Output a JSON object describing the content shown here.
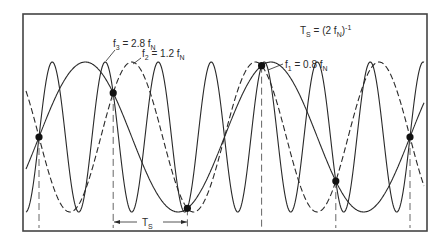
{
  "annotations": {
    "ts_def": {
      "main": "T",
      "sub": "S",
      "rest": " = (2 f",
      "sub2": "N",
      "tail": ")",
      "sup": "-1"
    },
    "f1": {
      "main": "f",
      "sub": "1",
      "rest": " = 0.8 f",
      "sub2": "N"
    },
    "f2": {
      "main": "f",
      "sub": "2",
      "rest": " = 1.2 f",
      "sub2": "N"
    },
    "f3": {
      "main": "f",
      "sub": "3",
      "rest": " = 2.8 f",
      "sub2": "N"
    },
    "ts_span": {
      "main": "T",
      "sub": "S"
    }
  },
  "signals": [
    {
      "name": "f1",
      "ratio_to_fN": 0.8,
      "style": "solid",
      "sign": 1
    },
    {
      "name": "f2",
      "ratio_to_fN": 1.2,
      "style": "dashed",
      "sign": -1
    },
    {
      "name": "f3",
      "ratio_to_fN": 2.8,
      "style": "solid",
      "sign": 1
    }
  ],
  "sampling": {
    "sample_count": 6,
    "fs_over_fN": 2
  },
  "colors": {
    "line": "#2a2a2a",
    "frame": "#444444",
    "dash": "#555555"
  }
}
